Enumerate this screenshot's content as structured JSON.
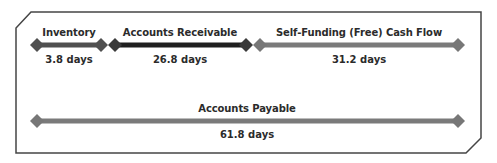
{
  "diagram": {
    "frame": {
      "stroke": "#454545"
    },
    "row1": {
      "segments": [
        {
          "id": "inventory",
          "label": "Inventory",
          "value": "3.8 days",
          "color": "#505050"
        },
        {
          "id": "accounts-receivable",
          "label": "Accounts Receivable",
          "value": "26.8 days",
          "color": "#1f1f1f"
        },
        {
          "id": "free-cash-flow",
          "label": "Self-Funding (Free) Cash Flow",
          "value": "31.2 days",
          "color": "#7a7a7a"
        }
      ]
    },
    "row2": {
      "segments": [
        {
          "id": "accounts-payable",
          "label": "Accounts Payable",
          "value": "61.8 days",
          "color": "#7a7a7a"
        }
      ]
    }
  }
}
